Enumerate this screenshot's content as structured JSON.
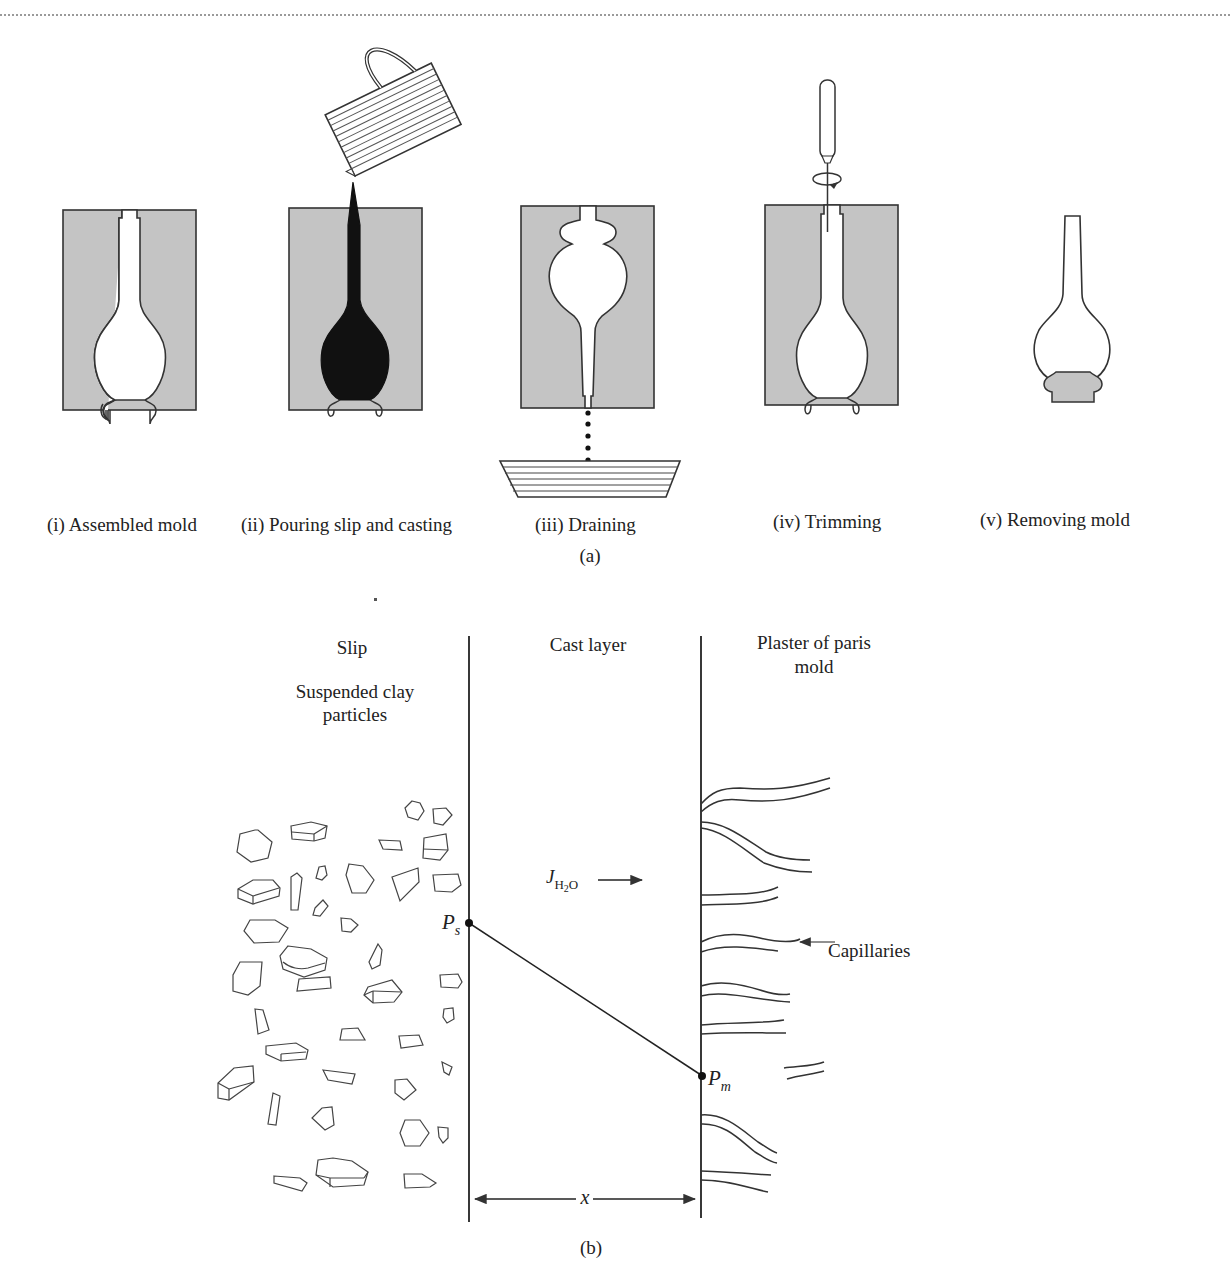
{
  "figure": {
    "part_a": {
      "label": "(a)",
      "steps": [
        {
          "label": "(i) Assembled mold"
        },
        {
          "label": "(ii) Pouring slip and casting"
        },
        {
          "label": "(iii) Draining"
        },
        {
          "label": "(iv) Trimming"
        },
        {
          "label": "(v) Removing mold"
        }
      ]
    },
    "part_b": {
      "label": "(b)",
      "regions": {
        "slip": "Slip",
        "slip_sub_line1": "Suspended clay",
        "slip_sub_line2": "particles",
        "cast_layer": "Cast layer",
        "mold_line1": "Plaster of paris",
        "mold_line2": "mold"
      },
      "flux_symbol": "J",
      "flux_subscript_h": "H",
      "flux_subscript_2": "2",
      "flux_subscript_o": "O",
      "pressure_slip_symbol": "P",
      "pressure_slip_sub": "s",
      "pressure_mold_symbol": "P",
      "pressure_mold_sub": "m",
      "capillaries_label": "Capillaries",
      "thickness_symbol": "x"
    },
    "colors": {
      "mold_gray": "#c4c4c4",
      "ink": "#222222",
      "slip_black": "#111111"
    }
  }
}
